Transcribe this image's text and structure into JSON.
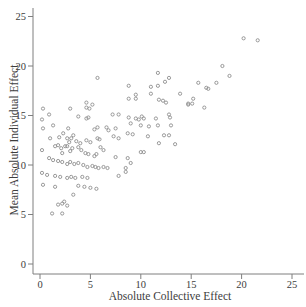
{
  "figure": {
    "background": "#ffffff"
  },
  "chart_data": {
    "type": "scatter",
    "title": "",
    "xlabel": "Absolute Collective Effect",
    "ylabel": "Mean Absolute Individual Effect",
    "xlim": [
      0,
      25
    ],
    "ylim": [
      0,
      25
    ],
    "xticks": [
      0,
      5,
      10,
      15,
      20,
      25
    ],
    "yticks": [
      0,
      5,
      10,
      15,
      20,
      25
    ],
    "grid": false,
    "legend": null,
    "marker": "open-circle",
    "marker_color": "#8f8f8f",
    "axis_color": "#7f7f7f",
    "text_color": "#3d3d3d",
    "points": [
      [
        20.2,
        22.8
      ],
      [
        21.6,
        22.6
      ],
      [
        18.1,
        20.0
      ],
      [
        18.8,
        19.0
      ],
      [
        17.5,
        18.3
      ],
      [
        5.7,
        18.8
      ],
      [
        11.7,
        19.3
      ],
      [
        12.8,
        18.8
      ],
      [
        8.8,
        18.0
      ],
      [
        11.0,
        17.9
      ],
      [
        11.7,
        18.0
      ],
      [
        12.4,
        18.4
      ],
      [
        15.7,
        18.3
      ],
      [
        16.5,
        17.8
      ],
      [
        16.7,
        17.7
      ],
      [
        9.5,
        17.1
      ],
      [
        11.0,
        17.2
      ],
      [
        13.9,
        17.2
      ],
      [
        8.8,
        16.7
      ],
      [
        9.5,
        16.7
      ],
      [
        11.8,
        16.6
      ],
      [
        12.2,
        16.5
      ],
      [
        12.5,
        16.3
      ],
      [
        15.2,
        16.7
      ],
      [
        14.7,
        16.2
      ],
      [
        15.1,
        16.2
      ],
      [
        4.6,
        16.3
      ],
      [
        5.2,
        16.1
      ],
      [
        14.7,
        16.1
      ],
      [
        16.3,
        15.8
      ],
      [
        3.0,
        15.7
      ],
      [
        4.6,
        15.8
      ],
      [
        4.9,
        15.7
      ],
      [
        3.8,
        14.9
      ],
      [
        4.6,
        14.7
      ],
      [
        4.8,
        14.8
      ],
      [
        7.2,
        15.1
      ],
      [
        7.8,
        15.1
      ],
      [
        0.9,
        15.1
      ],
      [
        0.3,
        15.7
      ],
      [
        0.2,
        14.6
      ],
      [
        0.3,
        13.7
      ],
      [
        1.3,
        14.0
      ],
      [
        2.8,
        13.7
      ],
      [
        5.4,
        13.6
      ],
      [
        5.7,
        13.8
      ],
      [
        6.6,
        13.8
      ],
      [
        6.8,
        13.5
      ],
      [
        7.5,
        13.7
      ],
      [
        1.0,
        12.7
      ],
      [
        2.7,
        12.7
      ],
      [
        3.1,
        12.7
      ],
      [
        4.6,
        12.5
      ],
      [
        5.7,
        12.7
      ],
      [
        7.3,
        12.9
      ],
      [
        7.8,
        12.7
      ],
      [
        0.2,
        11.5
      ],
      [
        1.5,
        11.9
      ],
      [
        1.8,
        12.0
      ],
      [
        2.1,
        11.7
      ],
      [
        2.5,
        11.9
      ],
      [
        2.7,
        11.9
      ],
      [
        3.2,
        11.7
      ],
      [
        3.8,
        11.8
      ],
      [
        4.5,
        11.2
      ],
      [
        4.8,
        11.1
      ],
      [
        5.6,
        11.1
      ],
      [
        7.5,
        10.8
      ],
      [
        0.9,
        10.7
      ],
      [
        1.3,
        10.5
      ],
      [
        1.8,
        10.4
      ],
      [
        2.2,
        10.3
      ],
      [
        2.7,
        10.1
      ],
      [
        3.0,
        10.3
      ],
      [
        3.4,
        10.1
      ],
      [
        3.8,
        10.2
      ],
      [
        4.3,
        10.0
      ],
      [
        4.7,
        9.8
      ],
      [
        5.2,
        9.9
      ],
      [
        5.5,
        9.8
      ],
      [
        5.8,
        9.7
      ],
      [
        6.3,
        9.8
      ],
      [
        6.7,
        9.7
      ],
      [
        0.2,
        9.2
      ],
      [
        0.7,
        9.0
      ],
      [
        1.5,
        8.9
      ],
      [
        2.0,
        8.8
      ],
      [
        2.7,
        8.7
      ],
      [
        3.1,
        8.8
      ],
      [
        3.5,
        8.7
      ],
      [
        4.2,
        8.8
      ],
      [
        4.7,
        8.7
      ],
      [
        0.3,
        8.0
      ],
      [
        1.5,
        7.8
      ],
      [
        3.8,
        7.9
      ],
      [
        4.4,
        7.8
      ],
      [
        5.0,
        7.7
      ],
      [
        5.6,
        7.6
      ],
      [
        2.3,
        13.2
      ],
      [
        3.3,
        13.0
      ],
      [
        4.0,
        12.2
      ],
      [
        3.0,
        11.4
      ],
      [
        2.2,
        11.2
      ],
      [
        5.0,
        12.3
      ],
      [
        5.9,
        12.6
      ],
      [
        6.3,
        11.5
      ],
      [
        5.4,
        10.9
      ],
      [
        6.0,
        11.8
      ],
      [
        4.1,
        11.5
      ],
      [
        3.6,
        12.4
      ],
      [
        2.9,
        12.3
      ],
      [
        1.9,
        12.8
      ],
      [
        8.8,
        14.8
      ],
      [
        9.5,
        14.7
      ],
      [
        9.8,
        14.6
      ],
      [
        10.1,
        14.9
      ],
      [
        10.3,
        14.7
      ],
      [
        11.5,
        14.7
      ],
      [
        12.8,
        15.1
      ],
      [
        12.9,
        14.8
      ],
      [
        9.0,
        14.2
      ],
      [
        10.0,
        14.0
      ],
      [
        10.8,
        13.9
      ],
      [
        11.7,
        14.0
      ],
      [
        13.0,
        14.0
      ],
      [
        8.7,
        13.2
      ],
      [
        9.2,
        13.1
      ],
      [
        10.7,
        12.9
      ],
      [
        12.3,
        13.0
      ],
      [
        12.8,
        13.0
      ],
      [
        11.8,
        12.2
      ],
      [
        13.4,
        12.1
      ],
      [
        10.0,
        11.3
      ],
      [
        10.3,
        11.3
      ],
      [
        8.7,
        10.7
      ],
      [
        9.0,
        10.2
      ],
      [
        8.5,
        9.7
      ],
      [
        8.5,
        9.3
      ],
      [
        7.8,
        8.9
      ],
      [
        3.3,
        7.0
      ],
      [
        1.8,
        6.0
      ],
      [
        2.2,
        6.1
      ],
      [
        2.4,
        6.3
      ],
      [
        2.7,
        5.9
      ],
      [
        1.2,
        5.1
      ],
      [
        2.2,
        5.1
      ]
    ]
  }
}
